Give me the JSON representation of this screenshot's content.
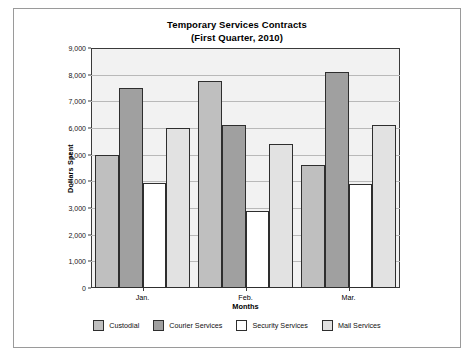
{
  "chart_data": {
    "type": "bar",
    "title": "Temporary Services Contracts",
    "subtitle": "(First Quarter, 2010)",
    "xlabel": "Months",
    "ylabel": "Dollars Spent",
    "categories": [
      "Jan.",
      "Feb.",
      "Mar."
    ],
    "ylim": [
      0,
      9000
    ],
    "ytick_step": 1000,
    "yticks": [
      "9,000",
      "8,000",
      "7,000",
      "6,000",
      "5,000",
      "4,000",
      "3,000",
      "2,000",
      "1,000",
      "0"
    ],
    "ytick_values": [
      9000,
      8000,
      7000,
      6000,
      5000,
      4000,
      3000,
      2000,
      1000,
      0
    ],
    "grid": true,
    "legend_position": "bottom",
    "series": [
      {
        "name": "Custodial",
        "color": "#bfbfbf",
        "values": [
          5000,
          7750,
          4600
        ]
      },
      {
        "name": "Courier Services",
        "color": "#a0a0a0",
        "values": [
          7500,
          6100,
          8100
        ]
      },
      {
        "name": "Security Services",
        "color": "#ffffff",
        "values": [
          3950,
          2900,
          3900
        ]
      },
      {
        "name": "Mail Services",
        "color": "#e2e2e2",
        "values": [
          6000,
          5400,
          6100
        ]
      }
    ]
  }
}
